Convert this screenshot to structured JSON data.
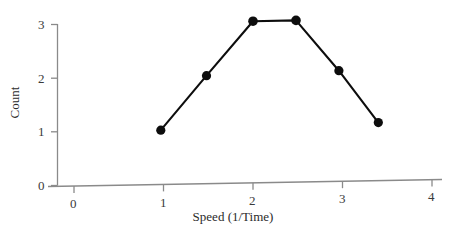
{
  "chart_data": {
    "type": "line",
    "title": "",
    "subtitle": "",
    "xlabel": "Speed (1/Time)",
    "ylabel": "Count",
    "xlim": [
      -0.17,
      4.38
    ],
    "ylim": [
      0,
      3.0
    ],
    "xticks": [
      0,
      1,
      2,
      3,
      4
    ],
    "xtick_labels": [
      "0",
      "1",
      "2",
      "3",
      "4"
    ],
    "yticks": [
      0,
      1,
      2,
      3
    ],
    "ytick_labels": [
      "0",
      "1",
      "2",
      "3"
    ],
    "grid": false,
    "legend": null,
    "marker": "filled-circle",
    "line_color": "#000000",
    "marker_color": "#000000",
    "axis_color": "#8a8a8a",
    "background": "#ffffff",
    "series": [
      {
        "name": "Count vs Speed",
        "x": [
          0.97,
          1.48,
          2.0,
          2.48,
          2.96,
          3.4
        ],
        "y": [
          1.0,
          2.0,
          3.0,
          3.0,
          2.05,
          1.07
        ]
      }
    ]
  }
}
